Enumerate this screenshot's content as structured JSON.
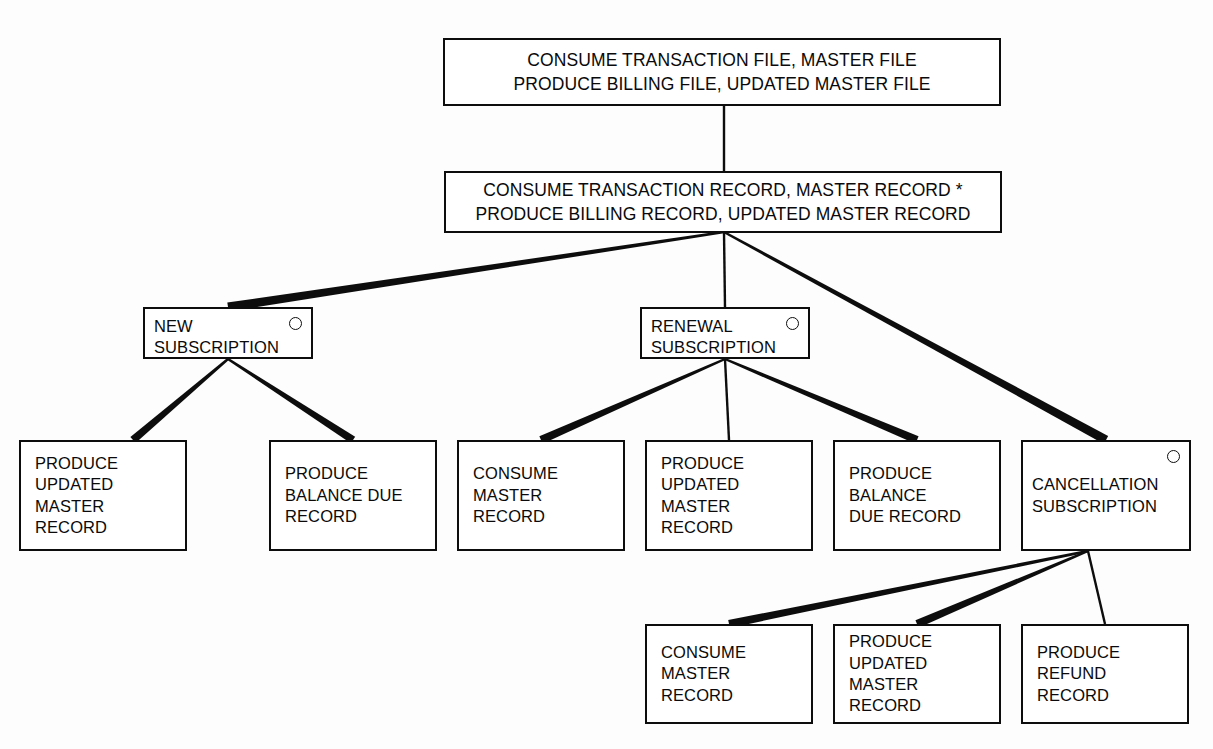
{
  "diagram": {
    "stroke_color": "#0d0d0d",
    "background_color": "#ffffff",
    "loop_marker_icon": "loop-circle-icon"
  },
  "nodes": {
    "root": {
      "id": "consume-transaction-file",
      "line1": "CONSUME TRANSACTION FILE, MASTER FILE",
      "line2": "PRODUCE BILLING FILE, UPDATED MASTER FILE",
      "x": 443,
      "y": 38,
      "w": 558,
      "h": 68,
      "has_loop_marker": false
    },
    "level2": {
      "id": "consume-transaction-record",
      "line1": "CONSUME TRANSACTION RECORD, MASTER RECORD *",
      "line2": "PRODUCE BILLING RECORD, UPDATED MASTER RECORD",
      "x": 444,
      "y": 171,
      "w": 558,
      "h": 62,
      "has_loop_marker": false
    },
    "branches": [
      {
        "id": "new-subscription",
        "line1": "NEW",
        "line2": "SUBSCRIPTION",
        "x": 143,
        "y": 307,
        "w": 170,
        "h": 52,
        "has_loop_marker": true
      },
      {
        "id": "renewal-subscription",
        "line1": "RENEWAL",
        "line2": "SUBSCRIPTION",
        "x": 640,
        "y": 307,
        "w": 170,
        "h": 52,
        "has_loop_marker": true
      },
      {
        "id": "cancellation-subscription",
        "line1": "CANCELLATION",
        "line2": "SUBSCRIPTION",
        "x": 1021,
        "y": 440,
        "w": 170,
        "h": 111,
        "has_loop_marker": true
      }
    ],
    "leaves": [
      {
        "id": "new-produce-updated-master-record",
        "lines": [
          "PRODUCE",
          "UPDATED",
          "MASTER",
          "RECORD"
        ],
        "x": 19,
        "y": 440,
        "w": 168,
        "h": 111
      },
      {
        "id": "new-produce-balance-due-record",
        "lines": [
          "PRODUCE",
          "BALANCE DUE",
          "RECORD"
        ],
        "x": 269,
        "y": 440,
        "w": 168,
        "h": 111
      },
      {
        "id": "renewal-consume-master-record",
        "lines": [
          "CONSUME",
          "MASTER",
          "RECORD"
        ],
        "x": 457,
        "y": 440,
        "w": 168,
        "h": 111
      },
      {
        "id": "renewal-produce-updated-master-record",
        "lines": [
          "PRODUCE",
          "UPDATED",
          "MASTER",
          "RECORD"
        ],
        "x": 645,
        "y": 440,
        "w": 168,
        "h": 111
      },
      {
        "id": "renewal-produce-balance-due-record",
        "lines": [
          "PRODUCE",
          "BALANCE",
          "DUE RECORD"
        ],
        "x": 833,
        "y": 440,
        "w": 168,
        "h": 111
      },
      {
        "id": "cancel-consume-master-record",
        "lines": [
          "CONSUME",
          "MASTER",
          "RECORD"
        ],
        "x": 645,
        "y": 624,
        "w": 168,
        "h": 100
      },
      {
        "id": "cancel-produce-updated-master-record",
        "lines": [
          "PRODUCE",
          "UPDATED",
          "MASTER",
          "RECORD"
        ],
        "x": 833,
        "y": 624,
        "w": 168,
        "h": 100
      },
      {
        "id": "cancel-produce-refund-record",
        "lines": [
          "PRODUCE",
          "REFUND",
          "RECORD"
        ],
        "x": 1021,
        "y": 624,
        "w": 168,
        "h": 100
      }
    ]
  },
  "connectors": [
    {
      "id": "root-to-level2",
      "from": [
        724,
        106
      ],
      "to": [
        724,
        171
      ],
      "taper": 0
    },
    {
      "id": "level2-to-new",
      "from": [
        724,
        232
      ],
      "to": [
        228,
        307
      ],
      "taper": 9
    },
    {
      "id": "level2-to-renewal",
      "from": [
        724,
        232
      ],
      "to": [
        725,
        307
      ],
      "taper": 0
    },
    {
      "id": "level2-to-cancellation",
      "from": [
        724,
        232
      ],
      "to": [
        1106,
        440
      ],
      "taper": 9
    },
    {
      "id": "new-to-leaf1",
      "from": [
        228,
        359
      ],
      "to": [
        133,
        440
      ],
      "taper": 8
    },
    {
      "id": "new-to-leaf2",
      "from": [
        228,
        359
      ],
      "to": [
        353,
        440
      ],
      "taper": 8
    },
    {
      "id": "renewal-to-leaf1",
      "from": [
        725,
        359
      ],
      "to": [
        541,
        440
      ],
      "taper": 8
    },
    {
      "id": "renewal-to-leaf2",
      "from": [
        725,
        359
      ],
      "to": [
        729,
        440
      ],
      "taper": 0
    },
    {
      "id": "renewal-to-leaf3",
      "from": [
        725,
        359
      ],
      "to": [
        917,
        440
      ],
      "taper": 8
    },
    {
      "id": "cancel-to-leaf1",
      "from": [
        1088,
        551
      ],
      "to": [
        729,
        624
      ],
      "taper": 8
    },
    {
      "id": "cancel-to-leaf2",
      "from": [
        1088,
        551
      ],
      "to": [
        917,
        624
      ],
      "taper": 8
    },
    {
      "id": "cancel-to-leaf3",
      "from": [
        1088,
        551
      ],
      "to": [
        1105,
        624
      ],
      "taper": 0
    }
  ]
}
